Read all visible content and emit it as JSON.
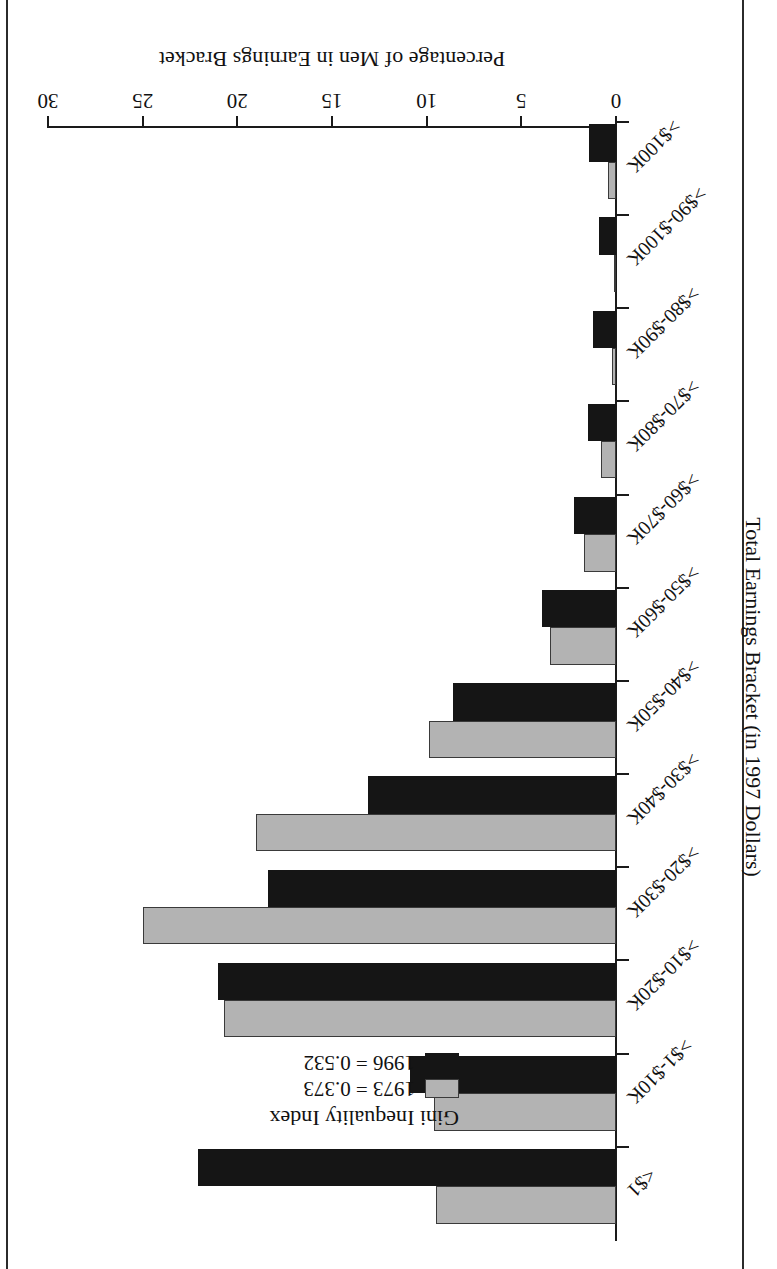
{
  "chart_data": {
    "type": "bar",
    "orientation": "horizontal",
    "title": "",
    "xlabel": "Percentage of Men in Earnings Bracket",
    "ylabel": "Total Earnings Bracket (in 1997 Dollars)",
    "xlim": [
      0,
      30
    ],
    "xticks": [
      0,
      5,
      10,
      15,
      20,
      25,
      30
    ],
    "grid": false,
    "legend_position": "upper-right-inside",
    "legend_title": "Gini Inequality Index",
    "categories": [
      "<$1",
      ">$1-$10K",
      ">$10-$20K",
      ">$20-$30K",
      ">$30-$40K",
      ">$40-$50K",
      ">$50-$60K",
      ">$60-$70K",
      ">$70-$80K",
      ">$80-$90K",
      ">$90-$100K",
      ">$100K"
    ],
    "series": [
      {
        "name": "1973 = 0.373",
        "year": "1973",
        "gini": "0.373",
        "color": "#b3b3b3",
        "values": [
          9.5,
          9.6,
          20.7,
          25.0,
          19.0,
          9.9,
          3.5,
          1.7,
          0.8,
          0.2,
          0.1,
          0.4
        ]
      },
      {
        "name": "1996 = 0.532",
        "year": "1996",
        "gini": "0.532",
        "color": "#151515",
        "values": [
          22.1,
          10.9,
          21.0,
          18.4,
          13.1,
          8.6,
          3.9,
          2.2,
          1.5,
          1.2,
          0.9,
          1.4
        ]
      }
    ]
  },
  "axes": {
    "value_axis_title": "Percentage of Men in Earnings Bracket",
    "category_axis_title": "Total Earnings Bracket (in 1997 Dollars)",
    "value_ticks": [
      "0",
      "5",
      "10",
      "15",
      "20",
      "25",
      "30"
    ]
  },
  "legend": {
    "title": "Gini Inequality Index",
    "entries": [
      {
        "label": "1973 = 0.373",
        "swatch": "gray-swatch"
      },
      {
        "label": "1996 = 0.532",
        "swatch": "black-swatch"
      }
    ]
  }
}
